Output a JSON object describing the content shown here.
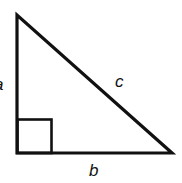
{
  "diagram": {
    "type": "right-triangle",
    "labels": {
      "a": "a",
      "b": "b",
      "c": "c"
    },
    "stroke_color": "#111111"
  }
}
